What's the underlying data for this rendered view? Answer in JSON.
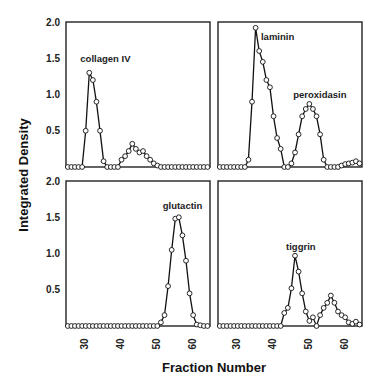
{
  "chart_data": {
    "type": "line",
    "xlabel": "Fraction Number",
    "ylabel": "Integrated Density",
    "ylim": [
      0,
      2.0
    ],
    "xlim": [
      25,
      64
    ],
    "yticks": [
      "0.5",
      "1.0",
      "1.5",
      "2.0"
    ],
    "xticks": [
      "30",
      "40",
      "50",
      "60"
    ],
    "grid": false,
    "marker": "open-circle",
    "panels": [
      {
        "position": "top-left",
        "annotations": [
          {
            "text": "collagen IV",
            "x": 28.5,
            "y": 1.45
          }
        ],
        "x": [
          25,
          26,
          27,
          28,
          29,
          30,
          31,
          32,
          33,
          34,
          35,
          36,
          37,
          38,
          39,
          40,
          41,
          42,
          43,
          44,
          45,
          46,
          47,
          48,
          49,
          50,
          51,
          52,
          53,
          54,
          55,
          56,
          57,
          58,
          59,
          60,
          61,
          62,
          63,
          64
        ],
        "values": [
          0,
          0,
          0,
          0,
          0,
          0.5,
          1.3,
          1.2,
          0.9,
          0.5,
          0.08,
          0,
          0,
          0,
          0,
          0.1,
          0.15,
          0.22,
          0.32,
          0.25,
          0.2,
          0.22,
          0.15,
          0.1,
          0.05,
          0.02,
          0,
          0,
          0,
          0,
          0,
          0,
          0,
          0,
          0,
          0,
          0,
          0,
          0,
          0
        ]
      },
      {
        "position": "top-right",
        "annotations": [
          {
            "text": "laminin",
            "x": 36.5,
            "y": 1.75
          },
          {
            "text": "peroxidasin",
            "x": 45.5,
            "y": 0.95
          }
        ],
        "x": [
          25,
          26,
          27,
          28,
          29,
          30,
          31,
          32,
          33,
          34,
          35,
          36,
          37,
          38,
          39,
          40,
          41,
          42,
          43,
          44,
          45,
          46,
          47,
          48,
          49,
          50,
          51,
          52,
          53,
          54,
          55,
          56,
          57,
          58,
          59,
          60,
          61,
          62,
          63,
          64
        ],
        "values": [
          0,
          0,
          0,
          0,
          0,
          0,
          0,
          0,
          0.1,
          0.9,
          1.92,
          1.6,
          1.45,
          1.2,
          1.1,
          0.7,
          0.4,
          0.25,
          0,
          0,
          0.05,
          0.2,
          0.45,
          0.7,
          0.8,
          0.87,
          0.8,
          0.7,
          0.45,
          0.1,
          0,
          0,
          0,
          0,
          0.02,
          0.04,
          0.05,
          0.06,
          0.08,
          0.05
        ]
      },
      {
        "position": "bottom-left",
        "annotations": [
          {
            "text": "glutactin",
            "x": 51.5,
            "y": 1.62
          }
        ],
        "x": [
          25,
          26,
          27,
          28,
          29,
          30,
          31,
          32,
          33,
          34,
          35,
          36,
          37,
          38,
          39,
          40,
          41,
          42,
          43,
          44,
          45,
          46,
          47,
          48,
          49,
          50,
          51,
          52,
          53,
          54,
          55,
          56,
          57,
          58,
          59,
          60,
          61,
          62,
          63,
          64
        ],
        "values": [
          0,
          0,
          0,
          0,
          0,
          0,
          0,
          0,
          0,
          0,
          0,
          0,
          0,
          0,
          0,
          0,
          0,
          0,
          0,
          0,
          0,
          0,
          0,
          0,
          0,
          0,
          0.05,
          0.15,
          0.55,
          1.05,
          1.48,
          1.5,
          1.25,
          0.9,
          0.45,
          0.15,
          0.02,
          0.01,
          0,
          0
        ]
      },
      {
        "position": "bottom-right",
        "annotations": [
          {
            "text": "tiggrin",
            "x": 43.5,
            "y": 1.05
          }
        ],
        "x": [
          25,
          26,
          27,
          28,
          29,
          30,
          31,
          32,
          33,
          34,
          35,
          36,
          37,
          38,
          39,
          40,
          41,
          42,
          43,
          44,
          45,
          46,
          47,
          48,
          49,
          50,
          51,
          52,
          53,
          54,
          55,
          56,
          57,
          58,
          59,
          60,
          61,
          62,
          63,
          64
        ],
        "values": [
          0,
          0,
          0,
          0,
          0,
          0,
          0,
          0,
          0,
          0,
          0,
          0,
          0,
          0,
          0,
          0,
          0,
          0,
          0.18,
          0.25,
          0.52,
          0.97,
          0.75,
          0.45,
          0.2,
          0.07,
          0.12,
          0,
          0.15,
          0.25,
          0.32,
          0.42,
          0.32,
          0.2,
          0.15,
          0.12,
          0.05,
          0.03,
          0.06,
          0.02
        ]
      }
    ]
  }
}
